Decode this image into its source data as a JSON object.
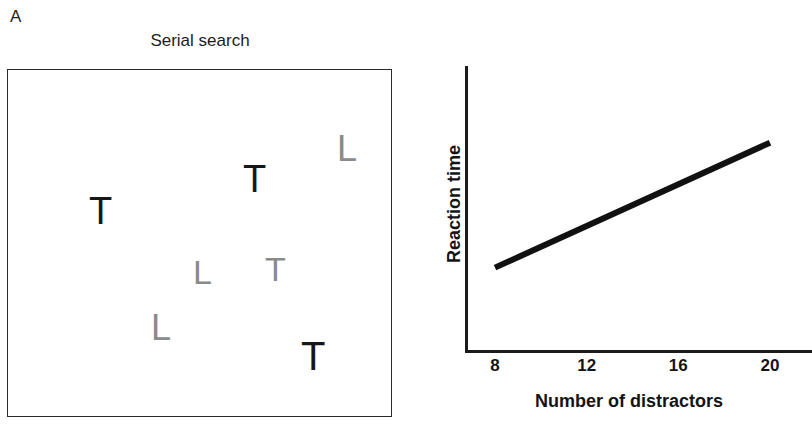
{
  "figure": {
    "panel_a_label": "A",
    "panel_b_label": "B"
  },
  "panel_a": {
    "title": "Serial search",
    "display": {
      "border_color": "#2b2b2b",
      "background": "#ffffff"
    },
    "target_color": "#171717",
    "distractor_color": "#8a8a8a",
    "stimuli": [
      {
        "char": "T",
        "role": "target",
        "x": 88,
        "y": 191,
        "size": 38,
        "color": "#171717",
        "weight": 400
      },
      {
        "char": "T",
        "role": "target",
        "x": 242,
        "y": 159,
        "size": 38,
        "color": "#171717",
        "weight": 400
      },
      {
        "char": "L",
        "role": "distractor",
        "x": 336,
        "y": 130,
        "size": 36,
        "color": "#8a8a8a",
        "weight": 400
      },
      {
        "char": "L",
        "role": "distractor",
        "x": 192,
        "y": 254,
        "size": 34,
        "color": "#8a8a8a",
        "weight": 400
      },
      {
        "char": "T",
        "role": "distractor",
        "x": 264,
        "y": 251,
        "size": 34,
        "color": "#8a8a8a",
        "weight": 400
      },
      {
        "char": "L",
        "role": "distractor",
        "x": 150,
        "y": 309,
        "size": 36,
        "color": "#8a8a8a",
        "weight": 400
      },
      {
        "char": "T",
        "role": "target",
        "x": 300,
        "y": 335,
        "size": 40,
        "color": "#171717",
        "weight": 400
      }
    ]
  },
  "panel_b": {
    "chart_data": {
      "type": "line",
      "title": "",
      "xlabel": "Number of distractors",
      "ylabel": "Reaction time",
      "x_tick_labels": [
        "8",
        "12",
        "16",
        "20"
      ],
      "x_tick_positions": [
        8,
        12,
        16,
        20
      ],
      "xlim": [
        8,
        20
      ],
      "ylim": [
        0,
        1
      ],
      "grid": false,
      "legend": null,
      "axis_color": "#1b1b1b",
      "line_color": "#111111",
      "line_width": 6,
      "series": [
        {
          "name": "Serial search slope",
          "x": [
            8,
            20
          ],
          "y": [
            0.29,
            0.73
          ],
          "note": "Reaction time increases linearly with number of distractors"
        }
      ]
    }
  }
}
